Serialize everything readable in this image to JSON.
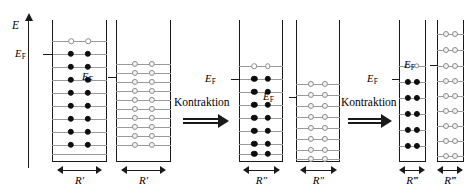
{
  "figure": {
    "type": "physics-energy-level-diagram",
    "axis": {
      "label": "E",
      "meaning": "energy-axis"
    },
    "transition_label_1": "Kontraktion",
    "transition_label_2": "Kontraktion",
    "fermi_label": "E",
    "fermi_sub": "F"
  },
  "wells": [
    {
      "id": "well-1",
      "width_label": "R′",
      "fermi_label": "E",
      "fermi_sub": "F",
      "occupancy": "filled",
      "levels_total": 10,
      "levels_occupied": 9,
      "levels_empty": 1,
      "columns": 2,
      "dot_style": "filled-black"
    },
    {
      "id": "well-2",
      "width_label": "R′",
      "fermi_label": "E",
      "fermi_sub": "F",
      "occupancy": "empty",
      "levels_total": 10,
      "levels_occupied": 0,
      "levels_empty": 10,
      "columns": 2,
      "dot_style": "open-gray"
    },
    {
      "id": "well-3",
      "width_label": "R″",
      "fermi_label": "E",
      "fermi_sub": "F",
      "occupancy": "filled",
      "levels_total": 8,
      "levels_occupied": 7,
      "levels_empty": 1,
      "columns": 2,
      "dot_style": "filled-black"
    },
    {
      "id": "well-4",
      "width_label": "R″",
      "fermi_label": "E",
      "fermi_sub": "F",
      "occupancy": "empty",
      "levels_total": 8,
      "levels_occupied": 0,
      "levels_empty": 8,
      "columns": 2,
      "dot_style": "open-gray"
    },
    {
      "id": "well-5",
      "width_label": "R‴",
      "fermi_label": "E",
      "fermi_sub": "F",
      "occupancy": "filled",
      "levels_total": 6,
      "levels_occupied": 5,
      "levels_empty": 1,
      "columns": 2,
      "dot_style": "filled-black"
    },
    {
      "id": "well-6",
      "width_label": "R‴",
      "fermi_label": "E",
      "fermi_sub": "F",
      "occupancy": "empty",
      "levels_total": 9,
      "levels_occupied": 0,
      "levels_empty": 9,
      "columns": 2,
      "dot_style": "open-gray"
    }
  ],
  "colors": {
    "ink": "#1a1a1a",
    "level_line": "#9a9a9a",
    "filled_dot": "#0d0d0d",
    "open_dot_stroke": "#8d8d8d",
    "background": "#ffffff"
  }
}
